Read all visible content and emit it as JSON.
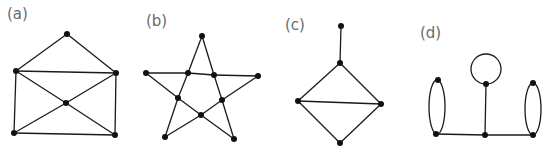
{
  "figure": {
    "colors": {
      "edge": "#1a1a1a",
      "vertex": "#111111",
      "label": "#6a6a6a",
      "background": "#ffffff"
    },
    "vertex_radius": 3,
    "graphs": [
      {
        "id": "a",
        "label": "(a)",
        "label_pos": [
          7,
          19
        ],
        "vertices": [
          [
            67,
            34
          ],
          [
            16,
            71
          ],
          [
            116,
            73
          ],
          [
            66,
            103
          ],
          [
            14,
            133
          ],
          [
            115,
            135
          ]
        ],
        "edges": [
          [
            0,
            1
          ],
          [
            0,
            2
          ],
          [
            1,
            2
          ],
          [
            1,
            3
          ],
          [
            2,
            3
          ],
          [
            3,
            4
          ],
          [
            3,
            5
          ],
          [
            1,
            4
          ],
          [
            2,
            5
          ],
          [
            4,
            5
          ]
        ],
        "loops": []
      },
      {
        "id": "b",
        "label": "(b)",
        "label_pos": [
          146,
          26
        ],
        "vertices": [
          [
            202,
            36
          ],
          [
            146,
            73
          ],
          [
            258,
            76
          ],
          [
            188,
            73
          ],
          [
            214,
            75
          ],
          [
            178,
            98
          ],
          [
            222,
            100
          ],
          [
            201,
            115
          ],
          [
            165,
            137
          ],
          [
            234,
            139
          ]
        ],
        "edges": [
          [
            0,
            3
          ],
          [
            0,
            4
          ],
          [
            1,
            3
          ],
          [
            3,
            4
          ],
          [
            4,
            2
          ],
          [
            1,
            5
          ],
          [
            5,
            7
          ],
          [
            7,
            6
          ],
          [
            6,
            2
          ],
          [
            3,
            5
          ],
          [
            5,
            8
          ],
          [
            4,
            6
          ],
          [
            6,
            9
          ],
          [
            7,
            8
          ],
          [
            7,
            9
          ]
        ],
        "loops": []
      },
      {
        "id": "c",
        "label": "(c)",
        "label_pos": [
          285,
          30
        ],
        "vertices": [
          [
            341,
            26
          ],
          [
            340,
            63
          ],
          [
            298,
            101
          ],
          [
            381,
            104
          ],
          [
            340,
            143
          ]
        ],
        "edges": [
          [
            0,
            1
          ],
          [
            1,
            2
          ],
          [
            1,
            3
          ],
          [
            2,
            3
          ],
          [
            2,
            4
          ],
          [
            3,
            4
          ]
        ],
        "loops": []
      },
      {
        "id": "d",
        "label": "(d)",
        "label_pos": [
          420,
          38
        ],
        "vertices": [
          [
            438,
            80
          ],
          [
            436,
            134
          ],
          [
            486,
            84
          ],
          [
            485,
            135
          ],
          [
            533,
            83
          ],
          [
            533,
            135
          ]
        ],
        "edges": [
          [
            2,
            3
          ],
          [
            1,
            3
          ],
          [
            3,
            5
          ]
        ],
        "loops": [
          {
            "type": "circle",
            "cx": 486,
            "cy": 69,
            "r": 15
          },
          {
            "type": "ellipse",
            "cx": 437,
            "cy": 107,
            "rx": 8,
            "ry": 27
          },
          {
            "type": "ellipse",
            "cx": 533,
            "cy": 109,
            "rx": 8,
            "ry": 26
          }
        ]
      }
    ]
  }
}
